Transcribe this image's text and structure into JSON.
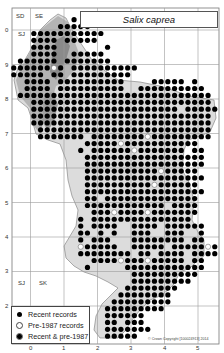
{
  "title": "Salix caprea",
  "legend": {
    "items": [
      {
        "symbol": "filled-dot",
        "label": "Recent records"
      },
      {
        "symbol": "open-dot",
        "label": "Pre-1987 records"
      },
      {
        "symbol": "filled-dot-ringed",
        "label": "Recent & pre-1987"
      }
    ]
  },
  "grid_squares": {
    "top": [
      "SD",
      "SE"
    ],
    "top_left_lower": "SJ",
    "bottom": [
      "SJ",
      "SK"
    ]
  },
  "axes": {
    "y_ticks": [
      "0",
      "9",
      "8",
      "7",
      "6",
      "5",
      "4",
      "3",
      "2"
    ],
    "x_ticks": [
      "0",
      "1",
      "2",
      "3",
      "4",
      "5"
    ]
  },
  "copyright": "© Crown Copyright [100024913] 2014",
  "colors": {
    "recent": "#000000",
    "pre": "#ffffff",
    "upland_dark": "#8a8a8a",
    "upland_mid": "#b4b4b4",
    "lowland_light": "#dcdcdc",
    "grid": "#999999"
  },
  "dot_grid": {
    "origin_x": 10.4,
    "origin_y": 9.4,
    "dx": 6.7,
    "dy": 6.88,
    "radius": 2.6,
    "legend_key": {
      "#": "recent",
      "o": "pre",
      "@": "both",
      ".": "none"
    },
    "rows": [
      "...............................",
      ".........#.....................",
      ".......#####...................",
      "...###########.................",
      "...####.#####..................",
      "...####.......#................",
      "...####..#####.................",
      ".######.#######................",
      "######o#.##########............",
      "#####.##.#########.............",
      "..####.##########....#####.#...",
      "..####.##########..##########..",
      ".#############################.",
      "...###########################.",
      "...######################.#####",
      "...###########################.",
      "...###########################.",
      "....##########################.",
      "....#######.########o#########.",
      "...........#####o###########...",
      "..........#.######o#######.##..",
      "...........##################..",
      "...........##################..",
      "...........###########o#####...",
      "...........##################..",
      "...........##########o######...",
      "...........##################..",
      "...........##.##############...",
      "...........############.####...",
      "............###o####o#######...",
      "..........#.###############....",
      "..........#.####..####.######..",
      "..........##.#.#..###..###..#..",
      "..........#.###...########.##..",
      "..........o#####..#####.#####o#",
      "..........########.##.####.####",
      "............####o###o#####.##..",
      "...........#.....############..",
      "..................##########...",
      "..................#########....",
      ".................########......",
      "................########.......",
      "...............#########.......",
      "..............#########........",
      "..............######...........",
      "..............##.###...........",
      "..............#######..........",
      "..............#####............"
    ]
  }
}
